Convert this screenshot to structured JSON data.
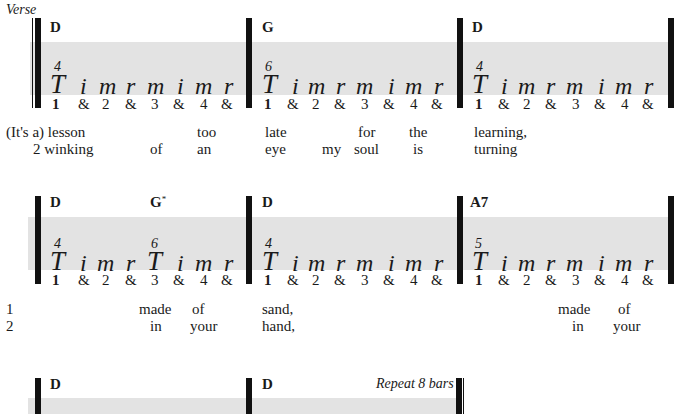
{
  "section_label": "Verse",
  "repeat_note": "Repeat 8 bars",
  "rows": [
    {
      "measures": [
        {
          "chords": [
            {
              "name": "D",
              "mark": ""
            }
          ],
          "pattern": [
            "T",
            "i",
            "m",
            "r",
            "m",
            "i",
            "m",
            "r"
          ],
          "fret_marks": [
            {
              "pos": 0,
              "num": "4"
            }
          ],
          "beats": [
            "1",
            "&",
            "2",
            "&",
            "3",
            "&",
            "4",
            "&"
          ]
        },
        {
          "chords": [
            {
              "name": "G",
              "mark": ""
            }
          ],
          "pattern": [
            "T",
            "i",
            "m",
            "r",
            "m",
            "i",
            "m",
            "r"
          ],
          "fret_marks": [
            {
              "pos": 0,
              "num": "6"
            }
          ],
          "beats": [
            "1",
            "&",
            "2",
            "&",
            "3",
            "&",
            "4",
            "&"
          ]
        },
        {
          "chords": [
            {
              "name": "D",
              "mark": ""
            }
          ],
          "pattern": [
            "T",
            "i",
            "m",
            "r",
            "m",
            "i",
            "m",
            "r"
          ],
          "fret_marks": [
            {
              "pos": 0,
              "num": "4"
            }
          ],
          "beats": [
            "1",
            "&",
            "2",
            "&",
            "3",
            "&",
            "4",
            "&"
          ]
        }
      ],
      "lyrics": [
        [
          "(It's a) lesson",
          "too",
          "late",
          "for",
          "the",
          "learning,"
        ],
        [
          "2 winking",
          "of",
          "an",
          "eye",
          "my",
          "soul",
          "is",
          "turning"
        ]
      ]
    },
    {
      "measures": [
        {
          "chords": [
            {
              "name": "D",
              "mark": ""
            },
            {
              "name": "G",
              "mark": "*"
            }
          ],
          "pattern": [
            "T",
            "i",
            "m",
            "r",
            "T",
            "i",
            "m",
            "r"
          ],
          "fret_marks": [
            {
              "pos": 0,
              "num": "4"
            },
            {
              "pos": 4,
              "num": "6"
            }
          ],
          "beats": [
            "1",
            "&",
            "2",
            "&",
            "3",
            "&",
            "4",
            "&"
          ]
        },
        {
          "chords": [
            {
              "name": "D",
              "mark": ""
            }
          ],
          "pattern": [
            "T",
            "i",
            "m",
            "r",
            "m",
            "i",
            "m",
            "r"
          ],
          "fret_marks": [
            {
              "pos": 0,
              "num": "4"
            }
          ],
          "beats": [
            "1",
            "&",
            "2",
            "&",
            "3",
            "&",
            "4",
            "&"
          ]
        },
        {
          "chords": [
            {
              "name": "A7",
              "mark": ""
            }
          ],
          "pattern": [
            "T",
            "i",
            "m",
            "r",
            "m",
            "i",
            "m",
            "r"
          ],
          "fret_marks": [
            {
              "pos": 0,
              "num": "5"
            }
          ],
          "beats": [
            "1",
            "&",
            "2",
            "&",
            "3",
            "&",
            "4",
            "&"
          ]
        }
      ],
      "lyrics": [
        [
          "1",
          "made",
          "of",
          "sand,",
          "made",
          "of"
        ],
        [
          "2",
          "in",
          "your",
          "hand,",
          "in",
          "your"
        ]
      ]
    },
    {
      "measures": [
        {
          "chords": [
            {
              "name": "D",
              "mark": ""
            }
          ]
        },
        {
          "chords": [
            {
              "name": "D",
              "mark": ""
            }
          ]
        }
      ]
    }
  ]
}
